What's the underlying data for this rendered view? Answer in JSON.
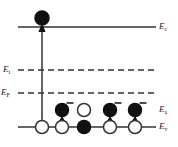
{
  "figure": {
    "type": "band-diagram",
    "background": "#ffffff",
    "line_color": "#333333",
    "fill_color": "#111111",
    "width": 178,
    "height": 147
  },
  "levels": [
    {
      "key": "Ec",
      "symbol": "E",
      "subscript": "c",
      "label": "Ec",
      "style": "solid",
      "y": 27,
      "x_start": 18,
      "x_end": 156,
      "label_x": 159,
      "label_y": 22
    },
    {
      "key": "Ei",
      "symbol": "E",
      "subscript": "i",
      "label": "Ei",
      "style": "dashed",
      "y": 70,
      "x_start": 18,
      "x_end": 156,
      "label_x": 3,
      "label_y": 65
    },
    {
      "key": "EF",
      "symbol": "E",
      "subscript": "F",
      "label": "EF",
      "style": "dashed",
      "y": 93,
      "x_start": 18,
      "x_end": 158,
      "label_x": 1,
      "label_y": 88
    },
    {
      "key": "Ea",
      "symbol": "E",
      "subscript": "a",
      "label": "Ea",
      "style": "implicit",
      "y": 110,
      "x_start": 0,
      "x_end": 0,
      "label_x": 159,
      "label_y": 105
    },
    {
      "key": "Ev",
      "symbol": "E",
      "subscript": "v",
      "label": "Ev",
      "style": "solid",
      "y": 127,
      "x_start": 18,
      "x_end": 156,
      "label_x": 159,
      "label_y": 122
    }
  ],
  "conduction_electron": {
    "name": "electron-in-conduction-band",
    "cx": 42,
    "cy": 18,
    "r": 7,
    "fill": "filled"
  },
  "excitation_arrow": {
    "name": "band-to-band-excitation-arrow",
    "x": 42,
    "y_from": 127,
    "y_to": 24
  },
  "acceptor_sites": [
    {
      "cx": 62,
      "cy": 110,
      "r": 6.5,
      "fill": "filled",
      "charge": "−",
      "charge_dx": 8,
      "charge_dy": -7,
      "arrow": true
    },
    {
      "cx": 84,
      "cy": 110,
      "r": 6.5,
      "fill": "open",
      "charge": "",
      "charge_dx": 0,
      "charge_dy": 0,
      "arrow": false
    },
    {
      "cx": 110,
      "cy": 110,
      "r": 6.5,
      "fill": "filled",
      "charge": "−",
      "charge_dx": 8,
      "charge_dy": -7,
      "arrow": true
    },
    {
      "cx": 135,
      "cy": 110,
      "r": 6.5,
      "fill": "filled",
      "charge": "−",
      "charge_dx": 8,
      "charge_dy": -7,
      "arrow": true
    }
  ],
  "valence_sites": [
    {
      "cx": 42,
      "cy": 127,
      "r": 6.5,
      "fill": "open"
    },
    {
      "cx": 62,
      "cy": 127,
      "r": 6.5,
      "fill": "open"
    },
    {
      "cx": 84,
      "cy": 127,
      "r": 6.5,
      "fill": "filled"
    },
    {
      "cx": 110,
      "cy": 127,
      "r": 6.5,
      "fill": "open"
    },
    {
      "cx": 135,
      "cy": 127,
      "r": 6.5,
      "fill": "open"
    }
  ]
}
